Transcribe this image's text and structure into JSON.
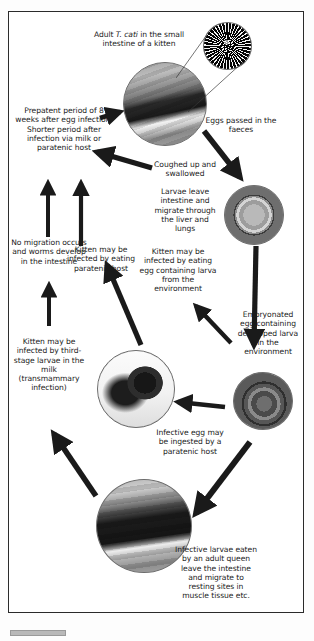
{
  "figure": {
    "type": "life-cycle-diagram",
    "border_color": "#2b2b2b",
    "text_color": "#1b1b1b",
    "arrow_color": "#1a1a1a"
  },
  "captions": [
    {
      "id": "adult-worm",
      "text": "Adult T. cati in the small intestine of a kitten",
      "italic_token": "T. cati"
    },
    {
      "id": "eggs-passed",
      "text": "Eggs passed in the faeces"
    },
    {
      "id": "prepatent",
      "text": "Prepatent period of 8 weeks after egg infection. Shorter period after infection via milk or paratenic host"
    },
    {
      "id": "coughed",
      "text": "Coughed up and swallowed"
    },
    {
      "id": "larvae-migrate",
      "text": "Larvae leave intestine and migrate through the liver and lungs"
    },
    {
      "id": "no-migration",
      "text": "No migration occurs and worms develop in the intestine"
    },
    {
      "id": "eat-paratenic",
      "text": "Kitten may be infected by eating paratenic host"
    },
    {
      "id": "eat-egg",
      "text": "Kitten may be infected by eating egg containing larva from the environment"
    },
    {
      "id": "embryonated-egg",
      "text": "Embryonated egg containing developed larva in the environment"
    },
    {
      "id": "transmammary",
      "text": "Kitten may be infected by third-stage larvae in the milk (transmammary infection)"
    },
    {
      "id": "infective-egg",
      "text": "Infective egg may be ingested by a paratenic host"
    },
    {
      "id": "infective-larvae",
      "text": "Infective larvae eaten by an adult queen leave the intestine and migrate to resting sites in muscle tissue etc."
    }
  ],
  "photos": [
    {
      "id": "worm-mass",
      "label": "adult roundworm mass photo"
    },
    {
      "id": "kitten-top",
      "label": "kitten photo"
    },
    {
      "id": "unembryonated-egg",
      "label": "Toxocara egg photo"
    },
    {
      "id": "embryonated-egg",
      "label": "embryonated egg with larva photo"
    },
    {
      "id": "mouse",
      "label": "mouse paratenic host photo"
    },
    {
      "id": "queen-cat",
      "label": "adult queen cat photo"
    }
  ],
  "arrows": [
    {
      "id": "arrow-worm-to-eggs",
      "from": "kitten-top",
      "to": "unembryonated-egg"
    },
    {
      "id": "arrow-egg-to-embryonated",
      "from": "unembryonated-egg",
      "to": "embryonated-egg"
    },
    {
      "id": "arrow-embryonated-to-mouse",
      "from": "embryonated-egg",
      "to": "mouse"
    },
    {
      "id": "arrow-embryonated-to-kitten",
      "from": "embryonated-egg",
      "to": "eat-egg"
    },
    {
      "id": "arrow-mouse-to-kitten",
      "from": "mouse",
      "to": "eat-paratenic"
    },
    {
      "id": "arrow-queen-to-embryonated",
      "from": "embryonated-egg",
      "to": "queen-cat"
    },
    {
      "id": "arrow-queen-to-milk",
      "from": "queen-cat",
      "to": "transmammary"
    },
    {
      "id": "arrow-milk-to-prepatent",
      "from": "transmammary",
      "to": "no-migration"
    },
    {
      "id": "arrow-paratenic-to-prepatent",
      "from": "eat-paratenic",
      "to": "prepatent"
    },
    {
      "id": "arrow-larvae-to-prepatent",
      "from": "larvae-migrate",
      "to": "prepatent"
    },
    {
      "id": "arrow-prepatent-to-kitten",
      "from": "prepatent",
      "to": "kitten-top"
    }
  ]
}
